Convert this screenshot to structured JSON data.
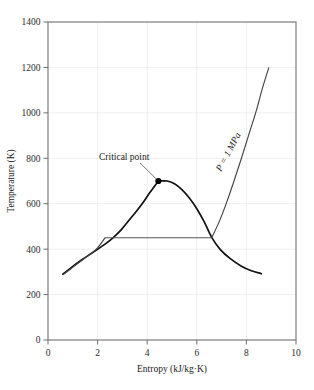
{
  "chart_data": {
    "type": "line",
    "title": "",
    "xlabel": "Entropy (kJ/kg·K)",
    "ylabel": "Temperature (K)",
    "xlim": [
      0,
      10
    ],
    "ylim": [
      0,
      1400
    ],
    "xticks": [
      "0",
      "2",
      "4",
      "6",
      "8",
      "10"
    ],
    "xtick_values": [
      0,
      2,
      4,
      6,
      8,
      10
    ],
    "yticks": [
      "0",
      "200",
      "400",
      "600",
      "800",
      "1000",
      "1200",
      "1400"
    ],
    "ytick_values": [
      0,
      200,
      400,
      600,
      800,
      1000,
      1200,
      1400
    ],
    "grid": true,
    "legend": "none",
    "series": [
      {
        "name": "saturated-liquid-line",
        "comment": "left branch of vapor dome rising from low-entropy compressed liquid to critical point",
        "points": [
          [
            0.6,
            290
          ],
          [
            0.95,
            320
          ],
          [
            1.35,
            352
          ],
          [
            1.8,
            385
          ],
          [
            2.3,
            422
          ],
          [
            2.62,
            450
          ],
          [
            2.95,
            485
          ],
          [
            3.25,
            525
          ],
          [
            3.55,
            565
          ],
          [
            3.85,
            608
          ],
          [
            4.1,
            648
          ],
          [
            4.45,
            700
          ]
        ]
      },
      {
        "name": "saturated-vapor-line",
        "comment": "right branch of vapor dome descending from critical point to high-entropy superheated vapor",
        "points": [
          [
            4.45,
            700
          ],
          [
            4.8,
            700
          ],
          [
            5.1,
            688
          ],
          [
            5.4,
            662
          ],
          [
            5.7,
            625
          ],
          [
            6.0,
            578
          ],
          [
            6.3,
            520
          ],
          [
            6.6,
            452
          ],
          [
            6.95,
            398
          ],
          [
            7.35,
            358
          ],
          [
            7.8,
            325
          ],
          [
            8.2,
            305
          ],
          [
            8.6,
            292
          ]
        ]
      },
      {
        "name": "isobar-compressed-liquid",
        "comment": "P = 1 MPa line in compressed-liquid region, nearly coincident with saturated liquid line",
        "points": [
          [
            0.62,
            288
          ],
          [
            1.05,
            325
          ],
          [
            1.5,
            362
          ],
          [
            1.95,
            400
          ],
          [
            2.3,
            450
          ]
        ]
      },
      {
        "name": "isobar-two-phase",
        "comment": "horizontal constant-pressure, constant-temperature segment across the dome",
        "points": [
          [
            2.3,
            450
          ],
          [
            6.6,
            450
          ]
        ]
      },
      {
        "name": "isobar-superheat",
        "comment": "P = 1 MPa line in superheated vapor region rising steeply",
        "points": [
          [
            6.6,
            450
          ],
          [
            6.9,
            520
          ],
          [
            7.2,
            605
          ],
          [
            7.5,
            700
          ],
          [
            7.8,
            800
          ],
          [
            8.1,
            905
          ],
          [
            8.4,
            1010
          ],
          [
            8.65,
            1110
          ],
          [
            8.9,
            1198
          ]
        ]
      }
    ],
    "annotations": [
      {
        "name": "critical-point",
        "label": "Critical point",
        "point": [
          4.45,
          700
        ],
        "marker": "filled-circle"
      },
      {
        "name": "isobar-pressure-label",
        "label": "P = 1 MPa",
        "rotation_deg": -62,
        "anchor": [
          7.0,
          770
        ]
      }
    ]
  },
  "axes": {
    "x_title": "Entropy (kJ/kg·K)",
    "y_title": "Temperature (K)"
  },
  "colors": {
    "dome_stroke": "#111111",
    "isobar_stroke": "#444444",
    "frame_stroke": "#6f6f6f",
    "grid_stroke": "#e6e6e6",
    "background": "#ffffff"
  }
}
